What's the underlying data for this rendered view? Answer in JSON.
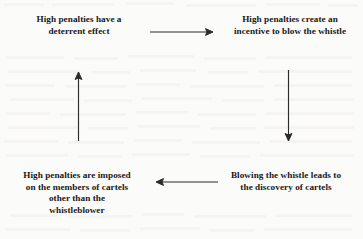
{
  "diagram": {
    "type": "cycle-flow",
    "background_color": "#fbfbf9",
    "text_color": "#19181b",
    "arrow_color": "#2b2a2c",
    "nodes": [
      {
        "id": "deterrent",
        "position": "top-left",
        "lines": [
          "High penalties have a",
          "deterrent effect"
        ]
      },
      {
        "id": "incentive",
        "position": "top-right",
        "lines": [
          "High penalties create an",
          "incentive to blow the whistle"
        ]
      },
      {
        "id": "discovery",
        "position": "bottom-right",
        "lines": [
          "Blowing the whistle leads to",
          "the discovery of cartels"
        ]
      },
      {
        "id": "imposed",
        "position": "bottom-left",
        "lines": [
          "High penalties are imposed",
          "on the members of cartels",
          "other than the",
          "whistleblower"
        ]
      }
    ],
    "arrows": [
      {
        "id": "deterrent-to-incentive",
        "direction": "right",
        "from": "deterrent",
        "to": "incentive"
      },
      {
        "id": "incentive-to-discovery",
        "direction": "down",
        "from": "incentive",
        "to": "discovery"
      },
      {
        "id": "discovery-to-imposed",
        "direction": "left",
        "from": "discovery",
        "to": "imposed"
      },
      {
        "id": "imposed-to-deterrent",
        "direction": "up",
        "from": "imposed",
        "to": "deterrent"
      }
    ]
  }
}
